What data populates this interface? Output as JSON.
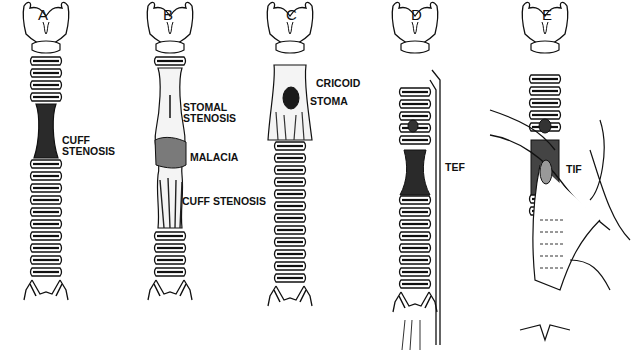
{
  "figure": {
    "panels": [
      {
        "letter": "A",
        "labels": [
          "CUFF",
          "STENOSIS"
        ]
      },
      {
        "letter": "B",
        "labels": [
          "STOMAL",
          "STENOSIS",
          "MALACIA",
          "CUFF STENOSIS"
        ],
        "signature": "Vojta"
      },
      {
        "letter": "C",
        "labels": [
          "CRICOID",
          "STOMA"
        ]
      },
      {
        "letter": "D",
        "labels": [
          "TEF"
        ]
      },
      {
        "letter": "E",
        "labels": [
          "TIF"
        ]
      }
    ]
  }
}
